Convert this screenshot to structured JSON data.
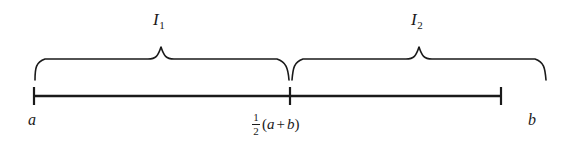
{
  "figure": {
    "stroke_color": "#1a1a1a",
    "background_color": "#ffffff"
  },
  "number_line": {
    "left_endpoint_label": "a",
    "right_endpoint_label": "b",
    "midpoint": {
      "numerator": "1",
      "denominator": "2",
      "open_paren": "(",
      "left_term": "a",
      "operator": "+",
      "right_term": "b",
      "close_paren": ")"
    }
  },
  "braces": [
    {
      "label": "I",
      "subscript": "1",
      "span": "a to midpoint"
    },
    {
      "label": "I",
      "subscript": "2",
      "span": "midpoint to b"
    }
  ]
}
